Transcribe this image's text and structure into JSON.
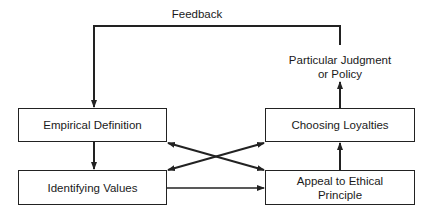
{
  "diagram": {
    "feedback_label": "Feedback",
    "output_label": "Particular Judgment\nor Policy",
    "boxes": {
      "empirical": "Empirical Definition",
      "values": "Identifying Values",
      "loyalties": "Choosing Loyalties",
      "principle": "Appeal to Ethical\nPrinciple"
    },
    "edges": [
      {
        "from": "Particular Judgment or Policy",
        "to": "Empirical Definition",
        "label": "Feedback"
      },
      {
        "from": "Empirical Definition",
        "to": "Identifying Values"
      },
      {
        "from": "Identifying Values",
        "to": "Appeal to Ethical Principle"
      },
      {
        "from": "Empirical Definition",
        "to": "Appeal to Ethical Principle",
        "bidirectional": true
      },
      {
        "from": "Identifying Values",
        "to": "Choosing Loyalties",
        "bidirectional": true
      },
      {
        "from": "Appeal to Ethical Principle",
        "to": "Choosing Loyalties"
      },
      {
        "from": "Choosing Loyalties",
        "to": "Particular Judgment or Policy"
      }
    ]
  }
}
